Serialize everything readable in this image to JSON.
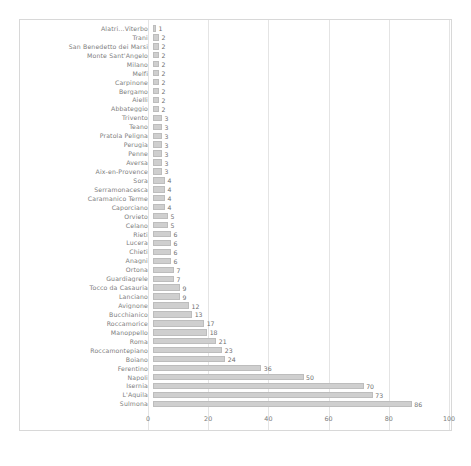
{
  "chart_data": {
    "type": "bar",
    "orientation": "horizontal",
    "title": "",
    "xlabel": "",
    "ylabel": "",
    "xlim": [
      0,
      100
    ],
    "xticks": [
      0,
      20,
      40,
      60,
      80,
      100
    ],
    "xtick_labels": [
      "0",
      "20",
      "40",
      "60",
      "80",
      "100"
    ],
    "grid": true,
    "legend": false,
    "bar_color": "#cfcfcf",
    "bar_edge_color": "#bdbdbd",
    "categories": [
      "Alatri...Viterbo",
      "Trani",
      "San Benedetto dei Marsi",
      "Monte Sant'Angelo",
      "Milano",
      "Melfi",
      "Carpinone",
      "Bergamo",
      "Aielli",
      "Abbateggio",
      "Trivento",
      "Teano",
      "Pratola Peligna",
      "Perugia",
      "Penne",
      "Aversa",
      "Aix-en-Provence",
      "Sora",
      "Serramonacesca",
      "Caramanico Terme",
      "Caporciano",
      "Orvieto",
      "Celano",
      "Rieti",
      "Lucera",
      "Chieti",
      "Anagni",
      "Ortona",
      "Guardiagrele",
      "Tocco da Casauria",
      "Lanciano",
      "Avignone",
      "Bucchianico",
      "Roccamorice",
      "Manoppello",
      "Roma",
      "Roccamontepiano",
      "Boiano",
      "Ferentino",
      "Napoli",
      "Isernia",
      "L'Aquila",
      "Sulmona"
    ],
    "values": [
      1,
      2,
      2,
      2,
      2,
      2,
      2,
      2,
      2,
      2,
      3,
      3,
      3,
      3,
      3,
      3,
      3,
      4,
      4,
      4,
      4,
      5,
      5,
      6,
      6,
      6,
      6,
      7,
      7,
      9,
      9,
      12,
      13,
      17,
      18,
      21,
      23,
      24,
      36,
      50,
      70,
      73,
      86
    ],
    "value_labels": [
      "1",
      "2",
      "2",
      "2",
      "2",
      "2",
      "2",
      "2",
      "2",
      "2",
      "3",
      "3",
      "3",
      "3",
      "3",
      "3",
      "3",
      "4",
      "4",
      "4",
      "4",
      "5",
      "5",
      "6",
      "6",
      "6",
      "6",
      "7",
      "7",
      "9",
      "9",
      "12",
      "13",
      "17",
      "18",
      "21",
      "23",
      "24",
      "36",
      "50",
      "70",
      "73",
      "86"
    ]
  },
  "caption": ""
}
